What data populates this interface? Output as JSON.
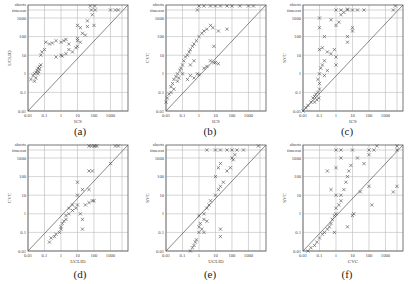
{
  "figure": {
    "panels": [
      {
        "id": "a",
        "caption": "(a)",
        "xlabel": "ICS",
        "ylabel": "UCLID"
      },
      {
        "id": "b",
        "caption": "(b)",
        "xlabel": "ICS",
        "ylabel": "CVC"
      },
      {
        "id": "c",
        "caption": "(c)",
        "xlabel": "ICS",
        "ylabel": "SVC"
      },
      {
        "id": "d",
        "caption": "(d)",
        "xlabel": "UCLID",
        "ylabel": "CVC"
      },
      {
        "id": "e",
        "caption": "(e)",
        "xlabel": "UCLID",
        "ylabel": "SVC"
      },
      {
        "id": "f",
        "caption": "(f)",
        "xlabel": "CVC",
        "ylabel": "SVC"
      }
    ],
    "x_ticks": [
      "0.01",
      "0.1",
      "1",
      "10",
      "100",
      "1000"
    ],
    "y_ticks": [
      "0.01",
      "0.1",
      "1",
      "10",
      "100",
      "1000"
    ],
    "y_extra_labels": [
      "timeout",
      "aborts"
    ]
  },
  "chart_data": [
    {
      "type": "scatter",
      "title": "(a)",
      "xlabel": "ICS",
      "ylabel": "UCLID",
      "xscale": "log",
      "yscale": "log",
      "xlim": [
        0.01,
        5000
      ],
      "ylim": [
        0.01,
        "aborts"
      ],
      "diagonal": true,
      "grid": true,
      "points": [
        [
          0.015,
          0.5
        ],
        [
          0.02,
          0.8
        ],
        [
          0.025,
          1
        ],
        [
          0.03,
          1.2
        ],
        [
          0.035,
          1.5
        ],
        [
          0.04,
          2
        ],
        [
          0.03,
          0.6
        ],
        [
          0.025,
          0.4
        ],
        [
          0.04,
          1
        ],
        [
          0.05,
          2.5
        ],
        [
          0.06,
          3
        ],
        [
          0.05,
          1.8
        ],
        [
          0.045,
          1.3
        ],
        [
          0.06,
          10
        ],
        [
          0.07,
          15
        ],
        [
          0.1,
          20
        ],
        [
          0.12,
          50
        ],
        [
          0.2,
          40
        ],
        [
          0.3,
          45
        ],
        [
          0.5,
          60
        ],
        [
          1,
          50
        ],
        [
          1.5,
          60
        ],
        [
          2,
          70
        ],
        [
          3,
          40
        ],
        [
          0.5,
          8
        ],
        [
          1,
          10
        ],
        [
          1.2,
          9
        ],
        [
          2,
          12
        ],
        [
          3,
          20
        ],
        [
          5,
          15
        ],
        [
          8,
          25
        ],
        [
          10,
          30
        ],
        [
          10,
          60
        ],
        [
          10,
          80
        ],
        [
          15,
          50
        ],
        [
          20,
          150
        ],
        [
          30,
          120
        ],
        [
          10,
          400
        ],
        [
          15,
          300
        ],
        [
          40,
          700
        ],
        [
          40,
          350
        ],
        [
          100,
          400
        ],
        [
          80,
          1500
        ],
        [
          70,
          "timeout"
        ],
        [
          120,
          "timeout"
        ],
        [
          1000,
          "timeout"
        ],
        [
          2000,
          "timeout"
        ],
        [
          3000,
          "timeout"
        ],
        [
          60,
          "aborts"
        ],
        [
          110,
          "aborts"
        ]
      ]
    },
    {
      "type": "scatter",
      "title": "(b)",
      "xlabel": "ICS",
      "ylabel": "CVC",
      "xscale": "log",
      "yscale": "log",
      "xlim": [
        0.01,
        5000
      ],
      "ylim": [
        0.01,
        "aborts"
      ],
      "diagonal": true,
      "grid": true,
      "points": [
        [
          0.01,
          0.03
        ],
        [
          0.012,
          0.05
        ],
        [
          0.015,
          0.08
        ],
        [
          0.02,
          0.1
        ],
        [
          0.02,
          0.2
        ],
        [
          0.025,
          0.3
        ],
        [
          0.03,
          0.15
        ],
        [
          0.03,
          0.5
        ],
        [
          0.04,
          0.7
        ],
        [
          0.05,
          1
        ],
        [
          0.05,
          0.4
        ],
        [
          0.06,
          0.6
        ],
        [
          0.07,
          1.5
        ],
        [
          0.08,
          2
        ],
        [
          0.1,
          3
        ],
        [
          0.1,
          1
        ],
        [
          0.12,
          5
        ],
        [
          0.15,
          8
        ],
        [
          0.2,
          10
        ],
        [
          0.25,
          15
        ],
        [
          0.3,
          20
        ],
        [
          0.4,
          30
        ],
        [
          0.5,
          40
        ],
        [
          0.7,
          60
        ],
        [
          1,
          100
        ],
        [
          1.5,
          150
        ],
        [
          2,
          200
        ],
        [
          3,
          250
        ],
        [
          5,
          400
        ],
        [
          7,
          300
        ],
        [
          15,
          200
        ],
        [
          50,
          250
        ],
        [
          0.2,
          0.5
        ],
        [
          0.3,
          0.8
        ],
        [
          0.5,
          0.6
        ],
        [
          0.8,
          1
        ],
        [
          1,
          0.9
        ],
        [
          2,
          2
        ],
        [
          3,
          2.5
        ],
        [
          5,
          5
        ],
        [
          8,
          4
        ],
        [
          10,
          4
        ],
        [
          15,
          3.5
        ],
        [
          8,
          30
        ],
        [
          0.5,
          5
        ],
        [
          0.3,
          3
        ],
        [
          0.8,
          "timeout"
        ],
        [
          1,
          "aborts"
        ],
        [
          2,
          "aborts"
        ],
        [
          5,
          "aborts"
        ],
        [
          10,
          "aborts"
        ],
        [
          20,
          "aborts"
        ],
        [
          50,
          "aborts"
        ],
        [
          100,
          "aborts"
        ],
        [
          300,
          "aborts"
        ],
        [
          1000,
          "aborts"
        ],
        [
          2000,
          "aborts"
        ]
      ]
    },
    {
      "type": "scatter",
      "title": "(c)",
      "xlabel": "ICS",
      "ylabel": "SVC",
      "xscale": "log",
      "yscale": "log",
      "xlim": [
        0.01,
        5000
      ],
      "ylim": [
        0.01,
        "aborts"
      ],
      "diagonal": true,
      "grid": true,
      "points": [
        [
          0.01,
          0.01
        ],
        [
          0.015,
          0.015
        ],
        [
          0.02,
          0.02
        ],
        [
          0.03,
          0.03
        ],
        [
          0.04,
          0.05
        ],
        [
          0.05,
          0.06
        ],
        [
          0.06,
          0.08
        ],
        [
          0.08,
          0.1
        ],
        [
          0.1,
          0.15
        ],
        [
          0.05,
          0.03
        ],
        [
          0.07,
          0.04
        ],
        [
          0.09,
          0.05
        ],
        [
          0.1,
          0.3
        ],
        [
          0.08,
          0.5
        ],
        [
          0.1,
          1
        ],
        [
          0.12,
          2
        ],
        [
          0.15,
          3
        ],
        [
          0.2,
          5
        ],
        [
          0.1,
          20
        ],
        [
          0.15,
          25
        ],
        [
          0.3,
          15
        ],
        [
          0.5,
          12
        ],
        [
          0.8,
          20
        ],
        [
          1,
          8
        ],
        [
          1,
          3
        ],
        [
          0.2,
          0.8
        ],
        [
          0.3,
          1.5
        ],
        [
          0.1,
          1000
        ],
        [
          0.1,
          300
        ],
        [
          0.2,
          100
        ],
        [
          0.5,
          800
        ],
        [
          1,
          400
        ],
        [
          1.5,
          600
        ],
        [
          2,
          1500
        ],
        [
          3,
          2000
        ],
        [
          5,
          3000
        ],
        [
          5,
          100
        ],
        [
          5,
          50
        ],
        [
          10,
          300
        ],
        [
          10,
          200
        ],
        [
          1,
          "timeout"
        ],
        [
          2,
          "timeout"
        ],
        [
          5,
          "timeout"
        ],
        [
          10,
          "timeout"
        ],
        [
          20,
          "timeout"
        ],
        [
          50,
          "timeout"
        ],
        [
          3000,
          "timeout"
        ],
        [
          4000,
          "aborts"
        ]
      ]
    },
    {
      "type": "scatter",
      "title": "(d)",
      "xlabel": "UCLID",
      "ylabel": "CVC",
      "xscale": "log",
      "yscale": "log",
      "xlim": [
        0.01,
        5000
      ],
      "ylim": [
        0.01,
        "aborts"
      ],
      "diagonal": true,
      "grid": true,
      "points": [
        [
          0.2,
          0.03
        ],
        [
          0.25,
          0.05
        ],
        [
          0.4,
          0.06
        ],
        [
          0.5,
          0.08
        ],
        [
          0.8,
          0.1
        ],
        [
          1,
          0.15
        ],
        [
          1,
          0.2
        ],
        [
          1.2,
          0.3
        ],
        [
          1.5,
          0.4
        ],
        [
          2,
          0.5
        ],
        [
          2,
          0.8
        ],
        [
          3,
          1
        ],
        [
          3,
          2
        ],
        [
          5,
          3
        ],
        [
          5,
          1.5
        ],
        [
          8,
          2
        ],
        [
          10,
          10
        ],
        [
          10,
          3
        ],
        [
          15,
          1
        ],
        [
          20,
          0.5
        ],
        [
          20,
          0.15
        ],
        [
          30,
          3
        ],
        [
          50,
          4
        ],
        [
          80,
          5
        ],
        [
          100,
          5
        ],
        [
          10,
          50
        ],
        [
          20,
          20
        ],
        [
          50,
          20
        ],
        [
          50,
          200
        ],
        [
          80,
          200
        ],
        [
          1000,
          500
        ],
        [
          50,
          "aborts"
        ],
        [
          70,
          "aborts"
        ],
        [
          100,
          "aborts"
        ],
        [
          120,
          "aborts"
        ],
        [
          150,
          "aborts"
        ],
        [
          2000,
          "aborts"
        ],
        [
          3000,
          "aborts"
        ]
      ]
    },
    {
      "type": "scatter",
      "title": "(e)",
      "xlabel": "UCLID",
      "ylabel": "SVC",
      "xscale": "log",
      "yscale": "log",
      "xlim": [
        0.01,
        5000
      ],
      "ylim": [
        0.01,
        "aborts"
      ],
      "diagonal": true,
      "grid": true,
      "points": [
        [
          0.3,
          0.01
        ],
        [
          0.4,
          0.015
        ],
        [
          0.5,
          0.02
        ],
        [
          0.6,
          0.03
        ],
        [
          0.7,
          0.04
        ],
        [
          1,
          0.1
        ],
        [
          1,
          0.2
        ],
        [
          1.2,
          0.3
        ],
        [
          1.5,
          0.15
        ],
        [
          2,
          0.1
        ],
        [
          2,
          0.5
        ],
        [
          3,
          0.4
        ],
        [
          1,
          0.8
        ],
        [
          2,
          1
        ],
        [
          3,
          2
        ],
        [
          4,
          3
        ],
        [
          5,
          5
        ],
        [
          10,
          10
        ],
        [
          15,
          20
        ],
        [
          20,
          30
        ],
        [
          30,
          50
        ],
        [
          10,
          100
        ],
        [
          15,
          300
        ],
        [
          20,
          500
        ],
        [
          50,
          200
        ],
        [
          80,
          300
        ],
        [
          100,
          1000
        ],
        [
          120,
          800
        ],
        [
          150,
          1500
        ],
        [
          20,
          0.15
        ],
        [
          20,
          0.06
        ],
        [
          3,
          "timeout"
        ],
        [
          10,
          "timeout"
        ],
        [
          20,
          "timeout"
        ],
        [
          50,
          "timeout"
        ],
        [
          100,
          "timeout"
        ],
        [
          200,
          "timeout"
        ],
        [
          500,
          "timeout"
        ],
        [
          4000,
          "aborts"
        ]
      ]
    },
    {
      "type": "scatter",
      "title": "(f)",
      "xlabel": "CVC",
      "ylabel": "SVC",
      "xscale": "log",
      "yscale": "log",
      "xlim": [
        0.01,
        5000
      ],
      "ylim": [
        0.01,
        "aborts"
      ],
      "diagonal": true,
      "grid": true,
      "points": [
        [
          0.02,
          0.01
        ],
        [
          0.03,
          0.015
        ],
        [
          0.05,
          0.02
        ],
        [
          0.07,
          0.03
        ],
        [
          0.1,
          0.05
        ],
        [
          0.15,
          0.08
        ],
        [
          0.2,
          0.1
        ],
        [
          0.3,
          0.15
        ],
        [
          0.4,
          0.2
        ],
        [
          0.5,
          0.3
        ],
        [
          0.6,
          0.5
        ],
        [
          0.8,
          0.8
        ],
        [
          1,
          1
        ],
        [
          1,
          2
        ],
        [
          1.5,
          3
        ],
        [
          2,
          5
        ],
        [
          2,
          10
        ],
        [
          3,
          20
        ],
        [
          4,
          50
        ],
        [
          5,
          100
        ],
        [
          6,
          200
        ],
        [
          8,
          400
        ],
        [
          1,
          10
        ],
        [
          0.5,
          20
        ],
        [
          0.3,
          200
        ],
        [
          1,
          300
        ],
        [
          2,
          1000
        ],
        [
          10,
          0.8
        ],
        [
          12,
          1
        ],
        [
          5,
          0.2
        ],
        [
          0.8,
          0.1
        ],
        [
          20,
          1000
        ],
        [
          50,
          500
        ],
        [
          100,
          1500
        ],
        [
          30,
          15
        ],
        [
          100,
          30
        ],
        [
          150,
          3
        ],
        [
          3000,
          15
        ],
        [
          1,
          "timeout"
        ],
        [
          2,
          "timeout"
        ],
        [
          10,
          "timeout"
        ],
        [
          100,
          "timeout"
        ],
        [
          200,
          "timeout"
        ],
        [
          300,
          "aborts"
        ],
        [
          5000,
          "aborts"
        ],
        [
          5000,
          "timeout"
        ],
        [
          5000,
          30
        ]
      ]
    }
  ]
}
